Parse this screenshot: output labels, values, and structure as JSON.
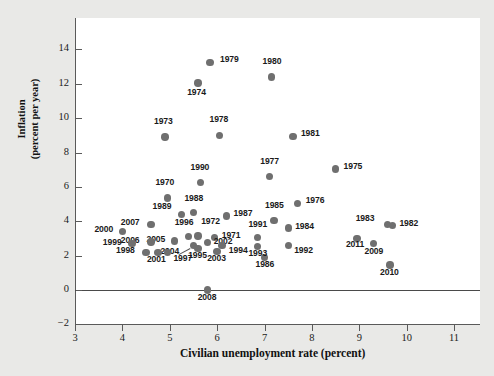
{
  "figure": {
    "background_color": "#e9e9e7",
    "panel_color": "#ffffff",
    "dot_color": "#6f6f6f",
    "axis_color": "#5a5a5a"
  },
  "chart_data": {
    "type": "scatter",
    "title": "",
    "xlabel": "Civilian unemployment rate (percent)",
    "ylabel": "Inflation\n(percent per year)",
    "ylabel_line1": "Inflation",
    "ylabel_line2": "(percent per year)",
    "xlim": [
      3,
      11.35
    ],
    "ylim": [
      -2,
      14.9
    ],
    "xticks": [
      3,
      4,
      5,
      6,
      7,
      8,
      9,
      10,
      11
    ],
    "yticks": [
      -2,
      0,
      2,
      4,
      6,
      8,
      10,
      12,
      14
    ],
    "xtick_labels": [
      "3",
      "4",
      "5",
      "6",
      "7",
      "8",
      "9",
      "10",
      "11"
    ],
    "ytick_labels": [
      "−2",
      "0",
      "2",
      "4",
      "6",
      "8",
      "10",
      "12",
      "14"
    ],
    "grid": false,
    "legend": "none",
    "zero_reference_line": 0,
    "point_label_key": "year",
    "points": [
      {
        "year": "1979",
        "x": 5.85,
        "y": 13.25,
        "lx": 10,
        "ly": -4
      },
      {
        "year": "1980",
        "x": 7.15,
        "y": 12.4,
        "lx": -9,
        "ly": -17
      },
      {
        "year": "1974",
        "x": 5.6,
        "y": 12.05,
        "lx": -11,
        "ly": 8
      },
      {
        "year": "1973",
        "x": 4.9,
        "y": 8.9,
        "lx": -11,
        "ly": -17
      },
      {
        "year": "1978",
        "x": 6.05,
        "y": 9.0,
        "lx": -10,
        "ly": -17
      },
      {
        "year": "1981",
        "x": 7.6,
        "y": 8.95,
        "lx": 8,
        "ly": -4
      },
      {
        "year": "1977",
        "x": 7.1,
        "y": 6.6,
        "lx": -9,
        "ly": -17
      },
      {
        "year": "1975",
        "x": 8.5,
        "y": 7.05,
        "lx": 8,
        "ly": -4
      },
      {
        "year": "1990",
        "x": 5.65,
        "y": 6.25,
        "lx": -10,
        "ly": -17
      },
      {
        "year": "1970",
        "x": 4.95,
        "y": 5.35,
        "lx": -12,
        "ly": -17
      },
      {
        "year": "1976",
        "x": 7.7,
        "y": 5.05,
        "lx": 8,
        "ly": -4
      },
      {
        "year": "1988",
        "x": 5.5,
        "y": 4.5,
        "lx": -9,
        "ly": -16
      },
      {
        "year": "1989",
        "x": 5.25,
        "y": 4.4,
        "lx": -29,
        "ly": -9
      },
      {
        "year": "1987",
        "x": 6.2,
        "y": 4.3,
        "lx": 7,
        "ly": -4
      },
      {
        "year": "1985",
        "x": 7.2,
        "y": 4.05,
        "lx": -9,
        "ly": -16
      },
      {
        "year": "1984",
        "x": 7.5,
        "y": 3.6,
        "lx": 7,
        "ly": -3
      },
      {
        "year": "1983",
        "x": 9.6,
        "y": 3.8,
        "lx": -32,
        "ly": -8
      },
      {
        "year": "1982",
        "x": 9.7,
        "y": 3.75,
        "lx": 7,
        "ly": -4
      },
      {
        "year": "2007",
        "x": 4.6,
        "y": 3.8,
        "lx": -30,
        "ly": -4
      },
      {
        "year": "2000",
        "x": 4.0,
        "y": 3.4,
        "lx": -28,
        "ly": -4
      },
      {
        "year": "1996",
        "x": 5.4,
        "y": 3.1,
        "lx": -14,
        "ly": -16
      },
      {
        "year": "1972",
        "x": 5.6,
        "y": 3.15,
        "lx": 3,
        "ly": -16
      },
      {
        "year": "1971",
        "x": 5.95,
        "y": 3.05,
        "lx": 7,
        "ly": -4
      },
      {
        "year": "1991",
        "x": 6.85,
        "y": 3.05,
        "lx": -9,
        "ly": -15
      },
      {
        "year": "1986",
        "x": 7.0,
        "y": 1.9,
        "lx": -9,
        "ly": 6
      },
      {
        "year": "2011",
        "x": 8.95,
        "y": 3.0,
        "lx": -11,
        "ly": 5
      },
      {
        "year": "2009",
        "x": 9.3,
        "y": 2.7,
        "lx": -9,
        "ly": 6
      },
      {
        "year": "2010",
        "x": 9.65,
        "y": 1.45,
        "lx": -10,
        "ly": 6
      },
      {
        "year": "2005",
        "x": 5.1,
        "y": 2.85,
        "lx": -28,
        "ly": -3
      },
      {
        "year": "2006",
        "x": 4.6,
        "y": 2.8,
        "lx": -30,
        "ly": -3
      },
      {
        "year": "1999",
        "x": 4.2,
        "y": 2.7,
        "lx": -29,
        "ly": -3
      },
      {
        "year": "2004",
        "x": 5.5,
        "y": 2.6,
        "lx": -33,
        "ly": 5
      },
      {
        "year": "2002",
        "x": 5.8,
        "y": 2.75,
        "lx": 6,
        "ly": -3
      },
      {
        "year": "1994",
        "x": 6.1,
        "y": 2.6,
        "lx": 7,
        "ly": 4
      },
      {
        "year": "1993",
        "x": 6.85,
        "y": 2.55,
        "lx": -9,
        "ly": 6
      },
      {
        "year": "1992",
        "x": 7.5,
        "y": 2.6,
        "lx": 6,
        "ly": 4
      },
      {
        "year": "1995",
        "x": 5.6,
        "y": 2.4,
        "lx": -10,
        "ly": 5
      },
      {
        "year": "2003",
        "x": 6.0,
        "y": 2.25,
        "lx": -10,
        "ly": 6
      },
      {
        "year": "1998",
        "x": 4.5,
        "y": 2.2,
        "lx": -30,
        "ly": -3
      },
      {
        "year": "2001",
        "x": 4.75,
        "y": 2.2,
        "lx": -11,
        "ly": 6
      },
      {
        "year": "1997",
        "x": 4.95,
        "y": 2.2,
        "lx": 6,
        "ly": 5
      },
      {
        "year": "2008",
        "x": 5.8,
        "y": 0.0,
        "lx": -10,
        "ly": 6
      }
    ]
  }
}
